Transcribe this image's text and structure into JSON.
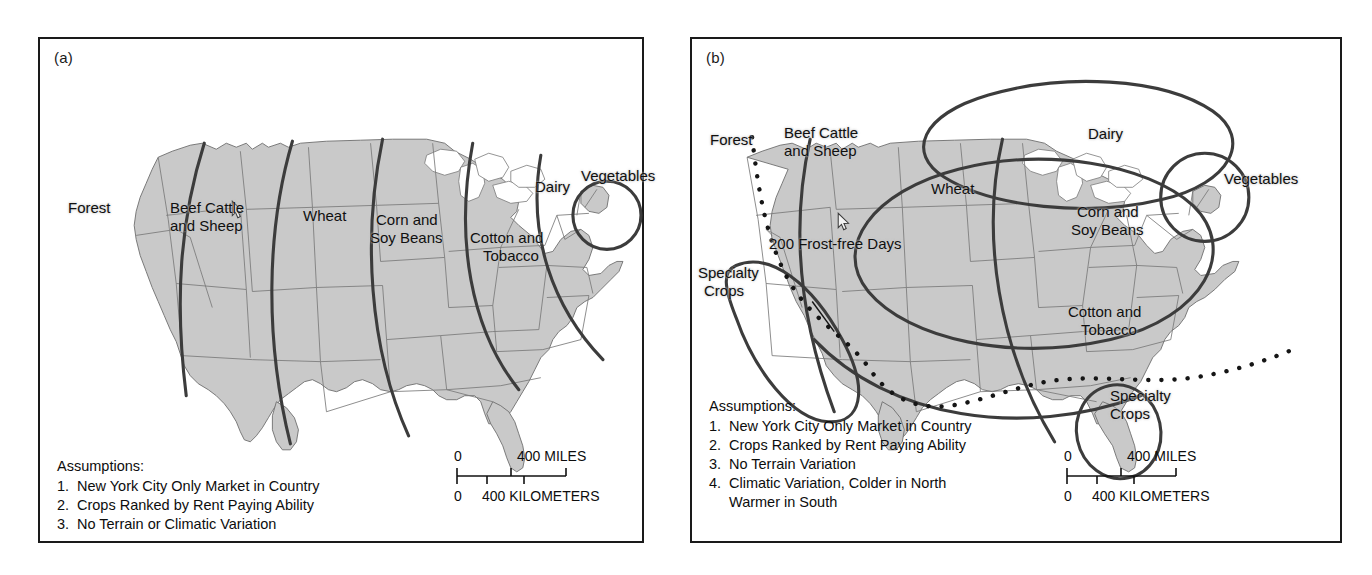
{
  "figure": {
    "background": "#ffffff",
    "land_fill": "#c9c9c9",
    "line_color": "#3c3c3c",
    "lake_fill": "#ffffff"
  },
  "panel_a": {
    "tag": "(a)",
    "zone_labels": [
      {
        "text": "Forest"
      },
      {
        "text": "Beef Cattle"
      },
      {
        "text": "and Sheep"
      },
      {
        "text": "Wheat"
      },
      {
        "text": "Corn and"
      },
      {
        "text": "Soy Beans"
      },
      {
        "text": "Cotton and"
      },
      {
        "text": "Tobacco"
      },
      {
        "text": "Dairy"
      },
      {
        "text": "Vegetables"
      }
    ],
    "assumptions": {
      "heading": "Assumptions:",
      "items": [
        {
          "num": "1.",
          "text": "New York City Only Market in Country"
        },
        {
          "num": "2.",
          "text": "Crops Ranked by Rent Paying Ability"
        },
        {
          "num": "3.",
          "text": "No Terrain or Climatic Variation"
        }
      ]
    },
    "scale": {
      "miles_zero": "0",
      "miles_label": "400 MILES",
      "km_zero": "0",
      "km_label": "400 KILOMETERS"
    }
  },
  "panel_b": {
    "tag": "(b)",
    "zone_labels": [
      {
        "text": "Forest"
      },
      {
        "text": "Beef Cattle"
      },
      {
        "text": "and Sheep"
      },
      {
        "text": "Wheat"
      },
      {
        "text": "Dairy"
      },
      {
        "text": "Vegetables"
      },
      {
        "text": "Corn and"
      },
      {
        "text": "Soy Beans"
      },
      {
        "text": "Cotton and"
      },
      {
        "text": "Tobacco"
      },
      {
        "text": "Specialty"
      },
      {
        "text": "Crops"
      },
      {
        "text": "Specialty"
      },
      {
        "text": "Crops"
      }
    ],
    "annotation": {
      "text": "200 Frost-free Days"
    },
    "assumptions": {
      "heading": "Assumptions:",
      "items": [
        {
          "num": "1.",
          "text": "New York City Only Market in Country"
        },
        {
          "num": "2.",
          "text": "Crops Ranked by Rent Paying Ability"
        },
        {
          "num": "3.",
          "text": "No Terrain Variation"
        },
        {
          "num": "4.",
          "text": "Climatic Variation, Colder in North"
        },
        {
          "num": "",
          "text": "Warmer in South"
        }
      ]
    },
    "scale": {
      "miles_zero": "0",
      "miles_label": "400 MILES",
      "km_zero": "0",
      "km_label": "400 KILOMETERS"
    }
  }
}
